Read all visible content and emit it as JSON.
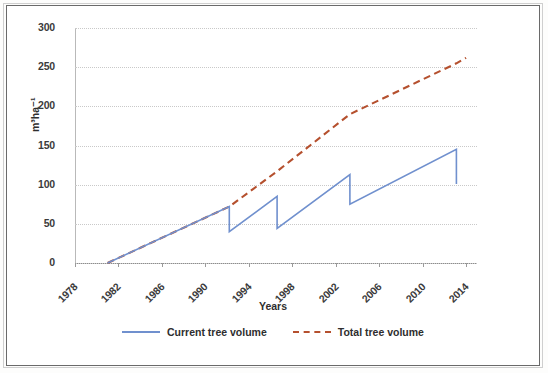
{
  "chart_data": {
    "type": "line",
    "title": "",
    "xlabel": "Years",
    "ylabel": "m³ha⁻¹",
    "xlim": [
      1978,
      2015
    ],
    "ylim": [
      0,
      300
    ],
    "yticks": [
      0,
      50,
      100,
      150,
      200,
      250,
      300
    ],
    "xticks": [
      1978,
      1982,
      1986,
      1990,
      1994,
      1998,
      2002,
      2006,
      2010,
      2014
    ],
    "grid": "horizontal-dotted",
    "legend_position": "bottom-center",
    "series": [
      {
        "name": "Current tree volume",
        "style": "solid",
        "color": "#7090ce",
        "points": [
          [
            1981.0,
            0
          ],
          [
            1992.2,
            72
          ],
          [
            1992.2,
            40
          ],
          [
            1996.6,
            85
          ],
          [
            1996.6,
            44
          ],
          [
            2003.3,
            113
          ],
          [
            2003.3,
            75
          ],
          [
            2013.1,
            145
          ],
          [
            2013.1,
            101
          ]
        ]
      },
      {
        "name": "Total tree volume",
        "style": "dashed",
        "color": "#b5502e",
        "points": [
          [
            1981.0,
            0
          ],
          [
            1992.2,
            72
          ],
          [
            1996.6,
            117
          ],
          [
            2003.3,
            190
          ],
          [
            2013.1,
            255
          ],
          [
            2014.0,
            262
          ]
        ]
      }
    ]
  },
  "legend": {
    "entries": [
      {
        "label": "Current tree volume",
        "style": "solid",
        "color": "#7090ce"
      },
      {
        "label": "Total tree volume",
        "style": "dashed",
        "color": "#b5502e"
      }
    ]
  },
  "axes": {
    "y_title": "m³ha⁻¹",
    "x_title": "Years",
    "y_labels": [
      "300",
      "250",
      "200",
      "150",
      "100",
      "50",
      "0"
    ],
    "x_labels": [
      "1978",
      "1982",
      "1986",
      "1990",
      "1994",
      "1998",
      "2002",
      "2006",
      "2010",
      "2014"
    ]
  }
}
